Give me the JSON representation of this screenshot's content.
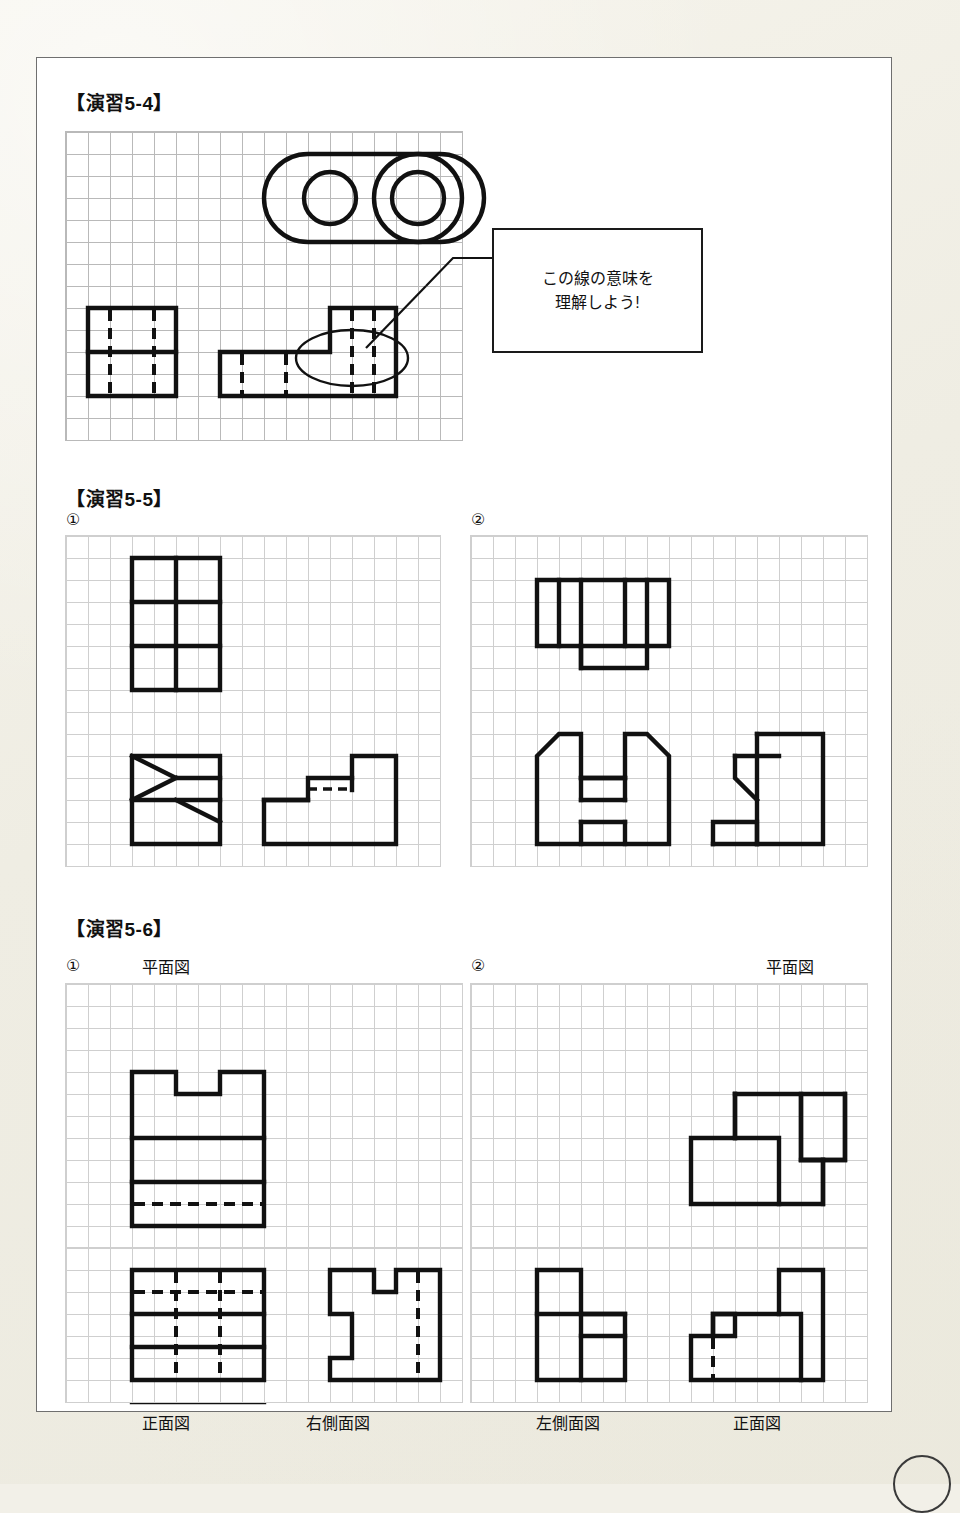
{
  "page": {
    "background_color": "#f2f0e8",
    "sheet_color": "#ffffff",
    "border_color": "#6f6f6f"
  },
  "sections": {
    "ex54": {
      "title": "【演習5-4】",
      "callout": "この線の意味を\n理解しよう!"
    },
    "ex55": {
      "title": "【演習5-5】",
      "item1_num": "①",
      "item2_num": "②"
    },
    "ex56": {
      "title": "【演習5-6】",
      "item1_num": "①",
      "item2_num": "②",
      "item1_plan_label": "平面図",
      "item1_front_label": "正面図",
      "item1_side_label": "右側面図",
      "item2_plan_label": "平面図",
      "item2_left_label": "左側面図",
      "item2_front_label": "正面図"
    }
  },
  "drawings": {
    "ex54": {
      "plan_view": "rounded-slot-plate-with-two-holes",
      "side_view": "stepped-rectangle-with-hidden-lines",
      "front_view": "L-shaped-block-with-hidden-lines",
      "highlight": "ellipse-callout-on-hidden-line"
    },
    "ex55": {
      "item1_plan": "2x3-grid-rectangle",
      "item1_front": "chamfered-block-with-slope",
      "item1_side": "stepped-profile-with-hidden-line",
      "item2_plan": "T-shape-with-hidden-line",
      "item2_front": "chamfered-block-with-slots",
      "item2_side": "stepped-profile-with-chamfer"
    },
    "ex56": {
      "item1_plan": "notched-rectangle-with-hidden-line",
      "item1_front": "3-band-rectangle-with-hidden-lines",
      "item1_side": "double-notched-profile-with-hidden-line",
      "item2_plan": "stepped-L-blocks",
      "item2_left": "two-column-stepped-profile",
      "item2_front": "stepped-profile-with-tower-and-hidden-line"
    }
  }
}
